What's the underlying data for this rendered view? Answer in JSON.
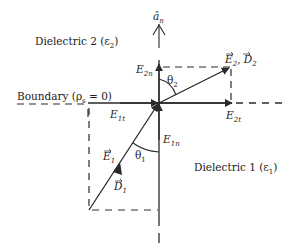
{
  "diagram": {
    "type": "boundary-conditions-dielectric-interface",
    "regions": {
      "upper": {
        "label": "Dielectric 2 (ε",
        "sub": "2",
        "close": ")"
      },
      "lower": {
        "label": "Dielectric 1 (ε",
        "sub": "1",
        "close": ")"
      }
    },
    "boundary": {
      "label": "Boundary (ρ",
      "sub": "s",
      "rest": " = 0)"
    },
    "normal": {
      "symbol": "â",
      "sub": "n"
    },
    "vectors": {
      "E2D2": {
        "e": "E",
        "e_sub": "2",
        "sep": ", ",
        "d": "D",
        "d_sub": "2"
      },
      "E1": {
        "e": "E",
        "e_sub": "1"
      },
      "D1": {
        "d": "D",
        "d_sub": "1"
      },
      "E2n": {
        "e": "E",
        "sub": "2n"
      },
      "E2t": {
        "e": "E",
        "sub": "2t"
      },
      "E1t": {
        "e": "E",
        "sub": "1t"
      },
      "E1n": {
        "e": "E",
        "sub": "1n"
      }
    },
    "angles": {
      "theta2": {
        "symbol": "θ",
        "sub": "2"
      },
      "theta1": {
        "symbol": "θ",
        "sub": "1"
      }
    },
    "colors": {
      "stroke": "#2a2a2a",
      "background": "#ffffff"
    }
  }
}
